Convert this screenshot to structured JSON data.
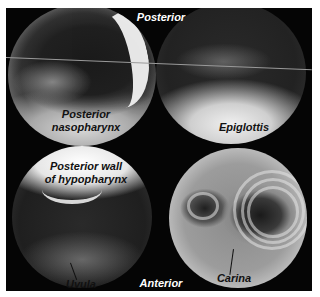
{
  "figure": {
    "orientation_top": "Posterior",
    "orientation_bottom": "Anterior",
    "panels": [
      {
        "position": "top-left",
        "label_lines": [
          "Posterior",
          "nasopharynx"
        ]
      },
      {
        "position": "top-right",
        "label_lines": [
          "Epiglottis"
        ]
      },
      {
        "position": "bottom-left",
        "label_lines": [
          "Posterior wall",
          "of hypopharynx"
        ],
        "pointer_label": "Uvula"
      },
      {
        "position": "bottom-right",
        "pointer_label": "Carina"
      }
    ]
  },
  "colors": {
    "background": "#050505",
    "page": "#ffffff",
    "label_light": "#ffffff",
    "label_dark": "#111111"
  }
}
